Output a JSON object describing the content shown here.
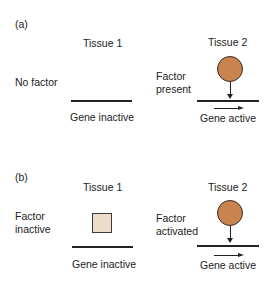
{
  "panel_a": {
    "label": "(a)",
    "tissue1": {
      "title": "Tissue 1",
      "condition": "No factor",
      "gene_state": "Gene inactive"
    },
    "tissue2": {
      "title": "Tissue 2",
      "condition_line1": "Factor",
      "condition_line2": "present",
      "gene_state": "Gene active"
    }
  },
  "panel_b": {
    "label": "(b)",
    "tissue1": {
      "title": "Tissue 1",
      "condition_line1": "Factor",
      "condition_line2": "inactive",
      "gene_state": "Gene inactive"
    },
    "tissue2": {
      "title": "Tissue 2",
      "condition_line1": "Factor",
      "condition_line2": "activated",
      "gene_state": "Gene active"
    }
  },
  "colors": {
    "active_factor": "#c8834f",
    "inactive_factor": "#eddcc9",
    "line": "#222222"
  }
}
